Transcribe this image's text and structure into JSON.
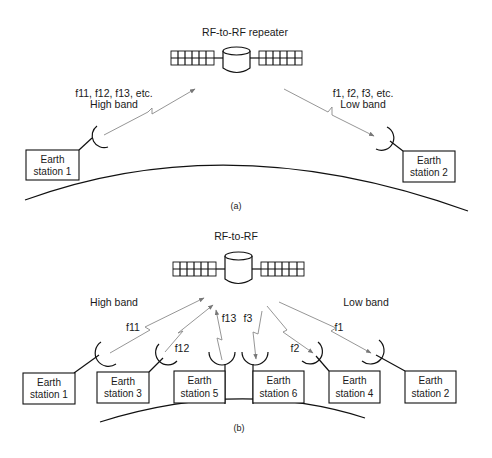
{
  "diagram_a": {
    "satellite_label": "RF-to-RF repeater",
    "uplink_label_line1": "f11, f12, f13, etc.",
    "uplink_label_line2": "High band",
    "downlink_label_line1": "f1, f2, f3, etc.",
    "downlink_label_line2": "Low band",
    "stations": [
      {
        "line1": "Earth",
        "line2": "station 1"
      },
      {
        "line1": "Earth",
        "line2": "station 2"
      }
    ],
    "caption": "(a)"
  },
  "diagram_b": {
    "satellite_label": "RF-to-RF",
    "high_band_label": "High band",
    "low_band_label": "Low band",
    "freq_labels": {
      "f11": "f11",
      "f12": "f12",
      "f13": "f13",
      "f3": "f3",
      "f2": "f2",
      "f1": "f1"
    },
    "stations": [
      {
        "line1": "Earth",
        "line2": "station 1"
      },
      {
        "line1": "Earth",
        "line2": "station 3"
      },
      {
        "line1": "Earth",
        "line2": "station 5"
      },
      {
        "line1": "Earth",
        "line2": "station 6"
      },
      {
        "line1": "Earth",
        "line2": "station 4"
      },
      {
        "line1": "Earth",
        "line2": "station 2"
      }
    ],
    "caption": "(b)"
  }
}
